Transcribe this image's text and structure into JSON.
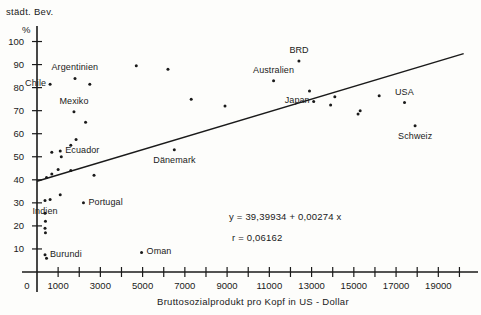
{
  "chart_data": {
    "type": "scatter",
    "title": "",
    "xlabel": "Bruttosozialprodukt pro Kopf in US - Dollar",
    "ylabel": "städt. Bev.",
    "ylabel_unit": "%",
    "xlim": [
      0,
      20500
    ],
    "ylim": [
      0,
      105
    ],
    "grid": false,
    "legend": "none",
    "x_ticks_major": [
      1000,
      3000,
      5000,
      7000,
      9000,
      11000,
      13000,
      15000,
      17000,
      19000
    ],
    "x_tick_labels": [
      "1000",
      "3000",
      "5000",
      "7000",
      "9000",
      "11000",
      "13000",
      "15000",
      "17000",
      "19000"
    ],
    "x_origin_label": "0",
    "x_ticks_minor": [
      2000,
      4000,
      6000,
      8000,
      10000,
      12000,
      14000,
      16000,
      18000,
      20000
    ],
    "y_ticks": [
      10,
      20,
      30,
      40,
      50,
      60,
      70,
      80,
      90,
      100
    ],
    "y_tick_labels": [
      "10",
      "20",
      "30",
      "40",
      "50",
      "60",
      "70",
      "80",
      "90",
      "100"
    ],
    "regression": {
      "equation_text": "y = 39,39934 + 0,00274 x",
      "correlation_text": "r = 0,06162",
      "intercept": 39.39934,
      "slope": 0.00274,
      "r": 0.06162,
      "x_start": 0,
      "x_end": 20200
    },
    "points": [
      {
        "x": 620,
        "y": 81.5,
        "label": "Chile",
        "label_pos": "left"
      },
      {
        "x": 1800,
        "y": 84.0,
        "label": "Argentinien",
        "label_pos": "above"
      },
      {
        "x": 2500,
        "y": 81.5,
        "label": "",
        "label_pos": ""
      },
      {
        "x": 1750,
        "y": 69.5,
        "label": "Mexiko",
        "label_pos": "above"
      },
      {
        "x": 2300,
        "y": 65.0,
        "label": "",
        "label_pos": ""
      },
      {
        "x": 1850,
        "y": 57.5,
        "label": "",
        "label_pos": ""
      },
      {
        "x": 1600,
        "y": 55.0,
        "label": "",
        "label_pos": ""
      },
      {
        "x": 1100,
        "y": 52.5,
        "label": "Ecuador",
        "label_pos": "right"
      },
      {
        "x": 700,
        "y": 52.0,
        "label": "",
        "label_pos": ""
      },
      {
        "x": 1150,
        "y": 50.0,
        "label": "",
        "label_pos": ""
      },
      {
        "x": 1000,
        "y": 44.5,
        "label": "",
        "label_pos": ""
      },
      {
        "x": 1600,
        "y": 44.0,
        "label": "",
        "label_pos": ""
      },
      {
        "x": 700,
        "y": 42.5,
        "label": "",
        "label_pos": ""
      },
      {
        "x": 2700,
        "y": 42.0,
        "label": "",
        "label_pos": ""
      },
      {
        "x": 450,
        "y": 41.0,
        "label": "",
        "label_pos": ""
      },
      {
        "x": 1100,
        "y": 33.5,
        "label": "",
        "label_pos": ""
      },
      {
        "x": 620,
        "y": 31.5,
        "label": "",
        "label_pos": ""
      },
      {
        "x": 380,
        "y": 31.0,
        "label": "Indien",
        "label_pos": "below"
      },
      {
        "x": 2200,
        "y": 30.0,
        "label": "Portugal",
        "label_pos": "right"
      },
      {
        "x": 380,
        "y": 25.5,
        "label": "",
        "label_pos": ""
      },
      {
        "x": 400,
        "y": 22.0,
        "label": "",
        "label_pos": ""
      },
      {
        "x": 380,
        "y": 19.0,
        "label": "",
        "label_pos": ""
      },
      {
        "x": 400,
        "y": 17.0,
        "label": "",
        "label_pos": ""
      },
      {
        "x": 380,
        "y": 7.5,
        "label": "Burundi",
        "label_pos": "right"
      },
      {
        "x": 450,
        "y": 6.0,
        "label": "",
        "label_pos": ""
      },
      {
        "x": 4950,
        "y": 8.5,
        "label": "Oman",
        "label_pos": "right"
      },
      {
        "x": 4700,
        "y": 89.5,
        "label": "",
        "label_pos": ""
      },
      {
        "x": 6200,
        "y": 88.0,
        "label": "",
        "label_pos": ""
      },
      {
        "x": 7300,
        "y": 75.0,
        "label": "",
        "label_pos": ""
      },
      {
        "x": 8900,
        "y": 72.0,
        "label": "",
        "label_pos": ""
      },
      {
        "x": 6500,
        "y": 53.0,
        "label": "Dänemark",
        "label_pos": "below"
      },
      {
        "x": 12400,
        "y": 91.5,
        "label": "BRD",
        "label_pos": "above"
      },
      {
        "x": 11200,
        "y": 83.0,
        "label": "Australien",
        "label_pos": "above"
      },
      {
        "x": 12900,
        "y": 78.5,
        "label": "",
        "label_pos": ""
      },
      {
        "x": 13100,
        "y": 74.0,
        "label": "Japan",
        "label_pos": "left"
      },
      {
        "x": 14100,
        "y": 76.0,
        "label": "",
        "label_pos": ""
      },
      {
        "x": 13900,
        "y": 72.5,
        "label": "",
        "label_pos": ""
      },
      {
        "x": 15200,
        "y": 68.5,
        "label": "",
        "label_pos": ""
      },
      {
        "x": 15300,
        "y": 70.0,
        "label": "",
        "label_pos": ""
      },
      {
        "x": 16200,
        "y": 76.5,
        "label": "",
        "label_pos": ""
      },
      {
        "x": 17400,
        "y": 73.5,
        "label": "USA",
        "label_pos": "above"
      },
      {
        "x": 17900,
        "y": 63.5,
        "label": "Schweiz",
        "label_pos": "below"
      }
    ],
    "annotations": [
      {
        "name": "regression-equation",
        "text": "y = 39,39934 + 0,00274 x"
      },
      {
        "name": "correlation-coefficient",
        "text": "r = 0,06162"
      }
    ]
  }
}
